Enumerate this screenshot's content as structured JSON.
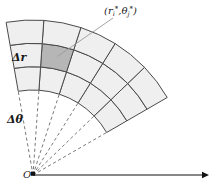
{
  "figure": {
    "background_color": "#ffffff",
    "labels": {
      "delta_r": "Δr",
      "delta_theta": "Δθ",
      "origin": "O",
      "sample_point_open": "(",
      "sample_point_r": "r",
      "sample_point_r_sub": "i",
      "sample_point_r_sup": "*",
      "sample_point_comma": ",",
      "sample_point_theta": "θ",
      "sample_point_theta_sub": "j",
      "sample_point_theta_sup": "*",
      "sample_point_close": ")",
      "sample_point_full": "(rᵢ*, θⱼ*)"
    },
    "colors": {
      "cell_fill": "#efefef",
      "cell_fill_highlight": "#b6b6b6",
      "stroke": "#4a4a4a",
      "dashed_ray": "#6b6b6b",
      "axis": "#111111",
      "leader_line": "#9a9a9a",
      "text": "#1a1a1a"
    },
    "geometry": {
      "origin_x": 33,
      "origin_y": 175,
      "inner_radius": 85,
      "outer_radius": 155,
      "angle_start_deg": 30,
      "angle_end_deg": 100,
      "radial_divisions": 3,
      "angular_divisions": 5,
      "highlight_ring_index": 1,
      "highlight_sector_index": 3,
      "dashed_ray_count": 6,
      "axis_y": 175,
      "axis_x_start": 33,
      "axis_x_end": 209
    },
    "chart_data": {
      "type": "diagram",
      "description": "Polar grid sector showing a small area element of dimensions delta-r by r-delta-theta",
      "rings": 3,
      "sectors": 5,
      "highlighted_cell": {
        "ring": 2,
        "sector": 4,
        "label": "(rᵢ*, θⱼ*)"
      }
    }
  }
}
